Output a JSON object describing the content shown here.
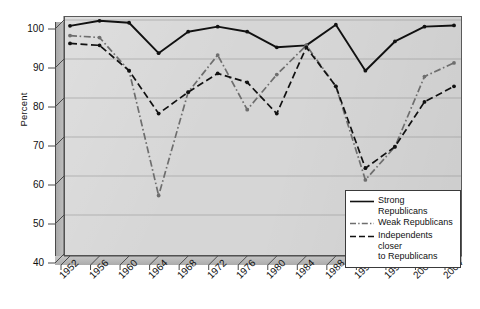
{
  "chart_data": {
    "type": "line",
    "title": "",
    "xlabel": "",
    "ylabel": "Percent",
    "ylim": [
      40,
      100
    ],
    "yticks": [
      40,
      50,
      60,
      70,
      80,
      90,
      100
    ],
    "grid": true,
    "legend_position": "bottom-right",
    "categories": [
      1952,
      1956,
      1960,
      1964,
      1968,
      1972,
      1976,
      1980,
      1984,
      1988,
      1992,
      1996,
      2000,
      2004
    ],
    "x_tick_labels": [
      "1952",
      "1956",
      "1960",
      "1964",
      "1968",
      "1972",
      "1976",
      "1980",
      "1984",
      "1988",
      "1992",
      "1996",
      "2000",
      "2004"
    ],
    "y_tick_labels": [
      "40",
      "50",
      "60",
      "70",
      "80",
      "90",
      "100"
    ],
    "series": [
      {
        "name": "Strong Republicans",
        "style": "solid",
        "color": "#111111",
        "values": [
          98.5,
          99.8,
          99.3,
          91.5,
          97.0,
          98.3,
          97.0,
          93.0,
          93.5,
          98.8,
          87.0,
          94.5,
          98.3,
          98.6
        ]
      },
      {
        "name": "Weak Republicans",
        "style": "dash-dot",
        "color": "#6e6e6e",
        "values": [
          96.0,
          95.5,
          87.0,
          55.0,
          81.5,
          91.0,
          77.0,
          86.0,
          93.5,
          83.0,
          59.0,
          67.5,
          85.5,
          89.0
        ]
      },
      {
        "name": "Independents closer to Republicans",
        "style": "dashed",
        "color": "#111111",
        "values": [
          94.0,
          93.5,
          87.0,
          76.0,
          81.5,
          86.3,
          84.0,
          76.0,
          93.0,
          83.0,
          62.0,
          67.5,
          79.0,
          83.0
        ]
      }
    ]
  },
  "legend": {
    "entries": [
      {
        "label": "Strong Republicans"
      },
      {
        "label": "Weak Republicans"
      },
      {
        "label": "Independents closer\nto Republicans"
      }
    ]
  },
  "colors": {
    "plot_background": "#d6d6d6",
    "wall": "#b9b9b9",
    "axis": "#4a4a4a",
    "gridline": "#9a9a9a",
    "series_strong": "#111111",
    "series_weak": "#6e6e6e",
    "series_independents": "#111111"
  }
}
